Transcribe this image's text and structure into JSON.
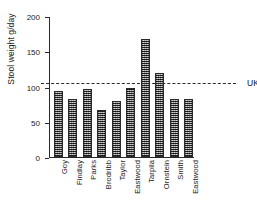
{
  "chart_data": {
    "type": "bar",
    "title": "",
    "xlabel": "",
    "ylabel": "Stool weight g/day",
    "categories": [
      "Goy",
      "Findlay",
      "Parks",
      "Brodribb",
      "Taylor",
      "Eastwood",
      "Tarpila",
      "Ornstein",
      "Smith",
      "Eastwood"
    ],
    "values": [
      94,
      83,
      96,
      66,
      79,
      98,
      167,
      119,
      82,
      82
    ],
    "ylim": [
      0,
      200
    ],
    "yticks": [
      0,
      50,
      100,
      150,
      200
    ],
    "ytick_labels": [
      "0",
      "50",
      "100",
      "150",
      "200"
    ],
    "grid": false,
    "legend": "none",
    "annotations": [
      {
        "name": "uk-median",
        "label": "UK median",
        "value": 106,
        "style": "dashed-horizontal-line"
      }
    ],
    "colors": {
      "bar_fill": "#5e5e5e",
      "bar_edge": "#2a2a2a",
      "axis": "#2b2b2b",
      "text": "#1a1a1a",
      "background": "#ffffff"
    }
  }
}
